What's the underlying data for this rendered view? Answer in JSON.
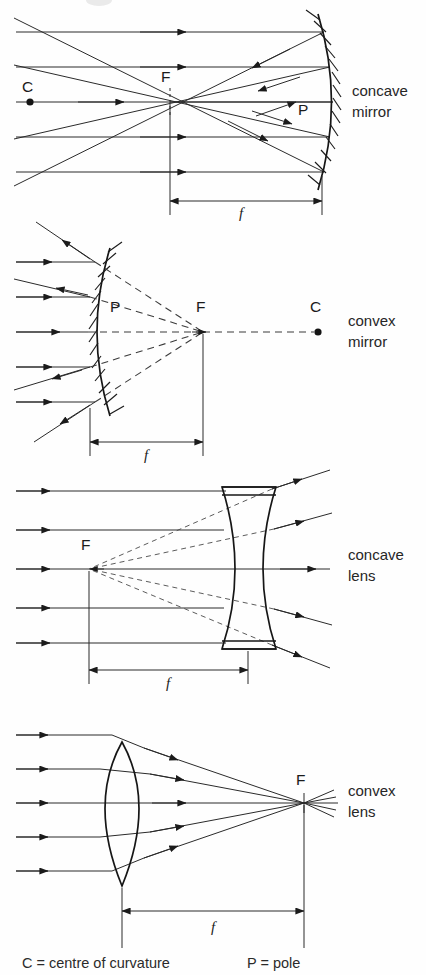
{
  "page": {
    "background": "#fefefe",
    "ink": "#1b1b1b",
    "width": 426,
    "height": 975
  },
  "diagrams": [
    {
      "id": "concave-mirror",
      "label_line1": "concave",
      "label_line2": "mirror",
      "focal_label": "F",
      "centre_label": "C",
      "pole_label": "P",
      "focal_length_label": "f",
      "element_type": "concave mirror",
      "ray_count": 5,
      "rays_converge": true,
      "f_axis_y": 102,
      "f_x": 170,
      "pole_x": 322,
      "centre_x": 30
    },
    {
      "id": "convex-mirror",
      "label_line1": "convex",
      "label_line2": "mirror",
      "focal_label": "F",
      "centre_label": "C",
      "pole_label": "P",
      "focal_length_label": "f",
      "element_type": "convex mirror",
      "ray_count": 5,
      "rays_converge": false,
      "f_axis_y": 332,
      "f_x": 203,
      "pole_x": 90,
      "centre_x": 318
    },
    {
      "id": "concave-lens",
      "label_line1": "concave",
      "label_line2": "lens",
      "focal_label": "F",
      "focal_length_label": "f",
      "element_type": "biconcave lens",
      "ray_count": 5,
      "rays_converge": false,
      "f_axis_y": 569,
      "f_x": 89,
      "lens_x": 249
    },
    {
      "id": "convex-lens",
      "label_line1": "convex",
      "label_line2": "lens",
      "focal_label": "F",
      "focal_length_label": "f",
      "element_type": "biconvex lens",
      "ray_count": 5,
      "rays_converge": true,
      "f_axis_y": 803,
      "f_x": 304,
      "lens_x": 122
    }
  ],
  "legend": {
    "centre": "C  =  centre of curvature",
    "pole": "P  =  pole"
  }
}
